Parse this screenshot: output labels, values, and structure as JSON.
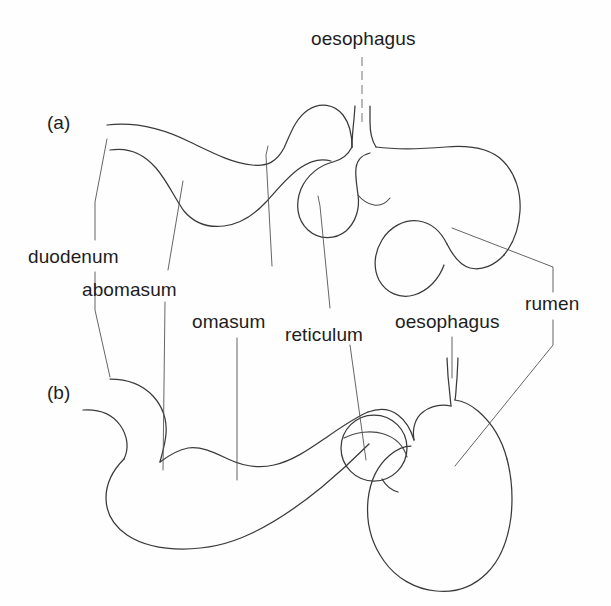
{
  "figure": {
    "background_color": "#fefefe",
    "ink_color": "#3a3a3a",
    "text_color": "#1d1d1d",
    "panels": [
      {
        "tag": "(a)",
        "name": "panel-a"
      },
      {
        "tag": "(b)",
        "name": "panel-b"
      }
    ]
  },
  "labels": {
    "oesophagus_top": "oesophagus",
    "duodenum": "duodenum",
    "abomasum": "abomasum",
    "omasum": "omasum",
    "reticulum": "reticulum",
    "oesophagus_mid": "oesophagus",
    "rumen": "rumen"
  },
  "panel_tags": {
    "a": "(a)",
    "b": "(b)"
  }
}
